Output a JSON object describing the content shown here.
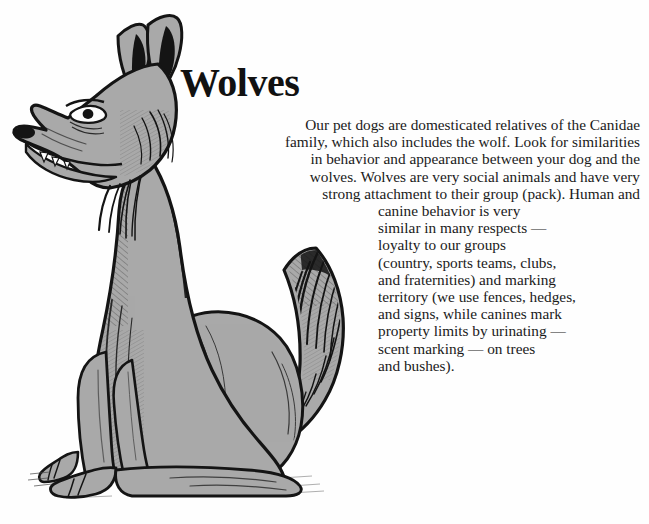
{
  "page": {
    "background_color": "#fefefe",
    "text_color": "#1a1a1a",
    "title_color": "#111111"
  },
  "article": {
    "title": "Wolves",
    "paragraph": "Our pet dogs are domesticated relatives of the Canidae family, which also includes the wolf. Look for similarities in behavior and appearance between your dog and the wolves. Wolves are very social animals and have very strong attachment to their group (pack). Human and canine behavior is very similar in many respects — loyalty to our groups (country, sports teams, clubs, and fraternities) and marking territory (we use fences, hedges, and signs, while canines mark property limits by urinating — scent marking — on trees and bushes).",
    "lines_upper": [
      "Our pet dogs are domesticated relatives of the Canidae",
      "family, which also includes the wolf. Look for similarities",
      "in behavior and appearance between your dog and the",
      "wolves. Wolves are very social animals and have very",
      "strong attachment to their group (pack). Human and"
    ],
    "lines_lower": [
      "canine behavior is very",
      "similar in many respects —",
      "loyalty to our groups",
      "(country, sports teams, clubs,",
      "and fraternities) and marking",
      "territory (we use fences, hedges,",
      "and signs, while canines mark",
      "property limits by urinating —",
      "scent marking — on trees",
      "and bushes)."
    ]
  },
  "illustration": {
    "subject": "wolf-sitting-side-view",
    "style": "pen-and-ink line drawing with flat gray fill",
    "fill_color": "#a9a9a9",
    "shadow_color": "#8e8e8e",
    "ink_color": "#141414",
    "highlight_color": "#fefefe"
  }
}
